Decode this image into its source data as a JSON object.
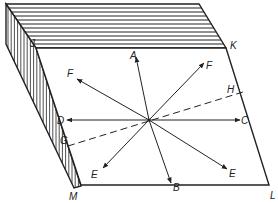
{
  "figure": {
    "colors": {
      "ink": "#222222",
      "background": "#ffffff"
    },
    "center_point": [
      149,
      120
    ],
    "faces": {
      "top": {
        "name": "top-face",
        "points": [
          [
            6,
            4
          ],
          [
            199,
            4
          ],
          [
            226,
            48
          ],
          [
            36,
            48
          ]
        ],
        "stripe_count": 10,
        "stripe_direction": "horizontal"
      },
      "left": {
        "name": "left-hatched-face",
        "points": [
          [
            6,
            4
          ],
          [
            36,
            48
          ],
          [
            81,
            186
          ],
          [
            74,
            188
          ],
          [
            6,
            44
          ]
        ],
        "hatch_direction": "vertical"
      },
      "front": {
        "name": "front-face",
        "points": [
          [
            36,
            48
          ],
          [
            226,
            48
          ],
          [
            269,
            185
          ],
          [
            81,
            185
          ]
        ]
      }
    },
    "vertices": {
      "J": {
        "label": "J",
        "x": 36,
        "y": 48,
        "label_x": 30,
        "label_y": 47
      },
      "K": {
        "label": "K",
        "x": 226,
        "y": 48,
        "label_x": 230,
        "label_y": 49
      },
      "L": {
        "label": "L",
        "x": 269,
        "y": 185,
        "label_x": 270,
        "label_y": 199
      },
      "M": {
        "label": "M",
        "x": 81,
        "y": 185,
        "label_x": 69,
        "label_y": 200
      }
    },
    "arrows": [
      {
        "id": "A",
        "label": "A",
        "to": [
          136,
          57
        ],
        "label_x": 130,
        "label_y": 59
      },
      {
        "id": "B",
        "label": "B",
        "to": [
          171,
          183
        ],
        "label_x": 173,
        "label_y": 191
      },
      {
        "id": "C",
        "label": "C",
        "to": [
          240,
          120
        ],
        "label_x": 241,
        "label_y": 124
      },
      {
        "id": "D",
        "label": "D",
        "to": [
          67,
          120
        ],
        "label_x": 57,
        "label_y": 124
      },
      {
        "id": "E-left",
        "label": "E",
        "to": [
          103,
          168
        ],
        "label_x": 91,
        "label_y": 178
      },
      {
        "id": "E-right",
        "label": "E",
        "to": [
          227,
          169
        ],
        "label_x": 229,
        "label_y": 177
      },
      {
        "id": "F-left",
        "label": "F",
        "to": [
          77,
          79
        ],
        "label_x": 67,
        "label_y": 77
      },
      {
        "id": "F-right",
        "label": "F",
        "to": [
          204,
          63
        ],
        "label_x": 206,
        "label_y": 69
      }
    ],
    "dashed_line": {
      "name": "cleavage-trace",
      "from": [
        68,
        146
      ],
      "to": [
        243,
        92
      ],
      "endpoints": [
        {
          "label": "G",
          "label_x": 60,
          "label_y": 144
        },
        {
          "label": "H",
          "label_x": 227,
          "label_y": 93
        }
      ]
    }
  }
}
